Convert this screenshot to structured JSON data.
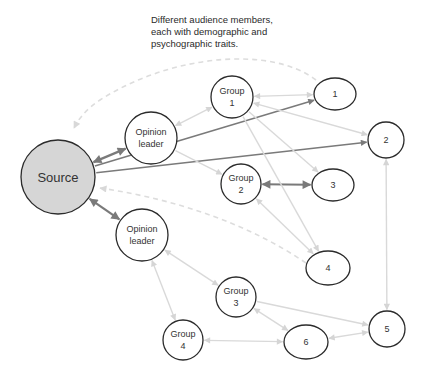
{
  "caption": {
    "lines": [
      "Different audience members,",
      "each with demographic and",
      "psychographic traits."
    ]
  },
  "colors": {
    "source_fill": "#d6d6d6",
    "node_fill": "#ffffff",
    "node_stroke": "#2b2b2b",
    "edge_strong": "#7a7a7a",
    "edge_light": "#d9d9d9",
    "edge_dashed": "#dddddd"
  },
  "nodes": [
    {
      "id": "source",
      "lines": [
        "Source"
      ],
      "cx": 58,
      "cy": 177,
      "rx": 37,
      "ry": 37,
      "fill": "source"
    },
    {
      "id": "ol1",
      "lines": [
        "Opinion",
        "leader"
      ],
      "cx": 151,
      "cy": 138,
      "rx": 26,
      "ry": 26
    },
    {
      "id": "ol2",
      "lines": [
        "Opinion",
        "leader"
      ],
      "cx": 142,
      "cy": 235,
      "rx": 26,
      "ry": 26
    },
    {
      "id": "g1",
      "lines": [
        "Group",
        "1"
      ],
      "cx": 232,
      "cy": 97,
      "rx": 21,
      "ry": 21
    },
    {
      "id": "g2",
      "lines": [
        "Group",
        "2"
      ],
      "cx": 241,
      "cy": 184,
      "rx": 20,
      "ry": 20
    },
    {
      "id": "g3",
      "lines": [
        "Group",
        "3"
      ],
      "cx": 236,
      "cy": 297,
      "rx": 20,
      "ry": 20
    },
    {
      "id": "g4",
      "lines": [
        "Group",
        "4"
      ],
      "cx": 183,
      "cy": 340,
      "rx": 20,
      "ry": 20
    },
    {
      "id": "n1",
      "lines": [
        "1"
      ],
      "cx": 335,
      "cy": 94,
      "rx": 21,
      "ry": 16
    },
    {
      "id": "n2",
      "lines": [
        "2"
      ],
      "cx": 386,
      "cy": 140,
      "rx": 18,
      "ry": 18
    },
    {
      "id": "n3",
      "lines": [
        "3"
      ],
      "cx": 333,
      "cy": 185,
      "rx": 21,
      "ry": 16
    },
    {
      "id": "n4",
      "lines": [
        "4"
      ],
      "cx": 328,
      "cy": 268,
      "rx": 22,
      "ry": 17
    },
    {
      "id": "n5",
      "lines": [
        "5"
      ],
      "cx": 387,
      "cy": 329,
      "rx": 18,
      "ry": 18
    },
    {
      "id": "n6",
      "lines": [
        "6"
      ],
      "cx": 306,
      "cy": 342,
      "rx": 22,
      "ry": 17
    }
  ],
  "edges": [
    {
      "from": "source",
      "to": "ol1",
      "style": "strong",
      "dir": "both"
    },
    {
      "from": "source",
      "to": "ol2",
      "style": "strong",
      "dir": "both"
    },
    {
      "from": "source",
      "to": "n1",
      "style": "strong-thin",
      "dir": "forward"
    },
    {
      "from": "source",
      "to": "n2",
      "style": "strong-thin",
      "dir": "forward"
    },
    {
      "from": "g2",
      "to": "n3",
      "style": "strong",
      "dir": "both"
    },
    {
      "from": "ol1",
      "to": "g1",
      "style": "light",
      "dir": "both"
    },
    {
      "from": "ol1",
      "to": "g2",
      "style": "light",
      "dir": "forward"
    },
    {
      "from": "g1",
      "to": "n1",
      "style": "light",
      "dir": "both"
    },
    {
      "from": "g1",
      "to": "n2",
      "style": "light",
      "dir": "both"
    },
    {
      "from": "g1",
      "to": "n3",
      "style": "light",
      "dir": "forward"
    },
    {
      "from": "g1",
      "to": "n4",
      "style": "light",
      "dir": "forward"
    },
    {
      "from": "g2",
      "to": "n4",
      "style": "light",
      "dir": "both"
    },
    {
      "from": "n2",
      "to": "n5",
      "style": "light",
      "dir": "both"
    },
    {
      "from": "ol2",
      "to": "g3",
      "style": "light",
      "dir": "both"
    },
    {
      "from": "ol2",
      "to": "g4",
      "style": "light",
      "dir": "both"
    },
    {
      "from": "g3",
      "to": "n5",
      "style": "light",
      "dir": "forward"
    },
    {
      "from": "g3",
      "to": "n6",
      "style": "light",
      "dir": "both"
    },
    {
      "from": "g4",
      "to": "n6",
      "style": "light",
      "dir": "both"
    },
    {
      "from": "n6",
      "to": "n5",
      "style": "light",
      "dir": "both"
    },
    {
      "from": "n1",
      "to": "source",
      "style": "dashed",
      "dir": "forward",
      "curve": "top"
    },
    {
      "from": "n4",
      "to": "source",
      "style": "dashed",
      "dir": "forward",
      "curve": "mid"
    }
  ]
}
